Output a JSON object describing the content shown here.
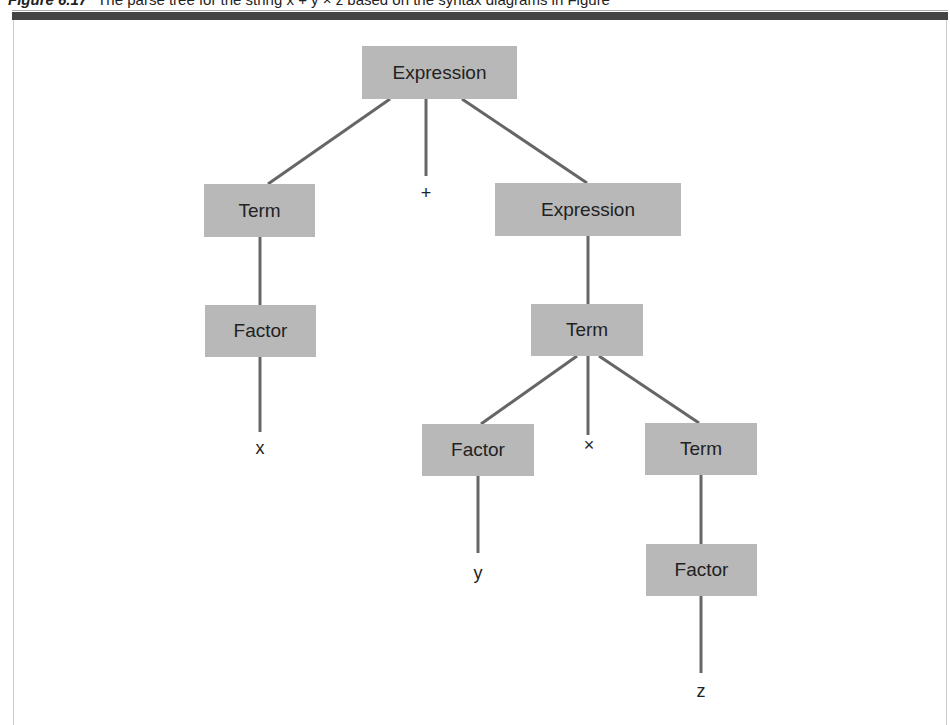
{
  "caption": {
    "figure_label": "Figure 6.17",
    "text": "The parse tree for the string x + y × z based on the syntax diagrams in Figure"
  },
  "tree": {
    "root": "Expression",
    "level1": {
      "left": "Term",
      "operator": "+",
      "right": "Expression"
    },
    "level2": {
      "left": "Factor",
      "right": "Term"
    },
    "level3": {
      "leaf_x": "x",
      "left": "Factor",
      "operator": "×",
      "right": "Term"
    },
    "level4": {
      "leaf_y": "y",
      "right": "Factor"
    },
    "level5": {
      "leaf_z": "z"
    }
  },
  "colors": {
    "node_fill": "#b8b8b8",
    "edge": "#666666",
    "text": "#222222"
  }
}
